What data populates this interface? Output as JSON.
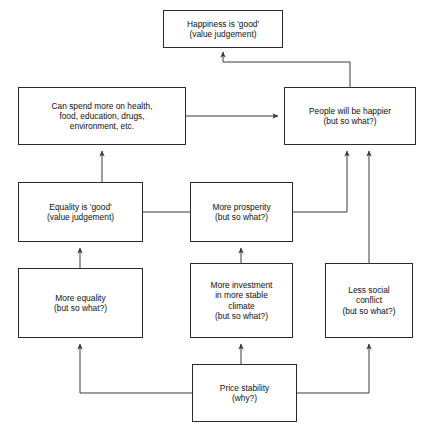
{
  "diagram": {
    "style": {
      "background": "#ffffff",
      "box_border": "#2b2b2b",
      "box_fill": "#ffffff",
      "connector": "#3a3a3a",
      "text": "#101010"
    },
    "nodes": [
      {
        "id": "happiness_good",
        "label": "Happiness is 'good'\n(value judgement)",
        "x": 163,
        "y": 10,
        "w": 120,
        "h": 38
      },
      {
        "id": "can_spend_more",
        "label": "Can spend more on health,\nfood, education, drugs,\nenvironment, etc.",
        "x": 18,
        "y": 87,
        "w": 168,
        "h": 58
      },
      {
        "id": "people_happier",
        "label": "People will be happier\n(but so what?)",
        "x": 284,
        "y": 87,
        "w": 132,
        "h": 58
      },
      {
        "id": "equality_good",
        "label": "Equality is 'good'\n(value judgement)",
        "x": 18,
        "y": 182,
        "w": 125,
        "h": 60
      },
      {
        "id": "more_prosperity",
        "label": "More prosperity\n(but so what?)",
        "x": 190,
        "y": 182,
        "w": 103,
        "h": 60
      },
      {
        "id": "more_equality",
        "label": "More equality\n(but so what?)",
        "x": 18,
        "y": 268,
        "w": 125,
        "h": 70
      },
      {
        "id": "more_investment",
        "label": "More investment\nin more stable\nclimate\n(but so what?)",
        "x": 190,
        "y": 263,
        "w": 103,
        "h": 75
      },
      {
        "id": "less_social_conflict",
        "label": "Less social\nconflict\n(but so what?)",
        "x": 325,
        "y": 263,
        "w": 88,
        "h": 75
      },
      {
        "id": "price_stability",
        "label": "Price stability\n(why?)",
        "x": 192,
        "y": 364,
        "w": 105,
        "h": 58
      }
    ],
    "connectors": [
      {
        "id": "people-happier-to-happiness-good",
        "from": "people_happier",
        "to": "happiness_good",
        "points": "350,87 350,62 223,62 223,52"
      },
      {
        "id": "can-spend-to-people-happier",
        "from": "can_spend_more",
        "to": "people_happier",
        "points": "186,116 278,116"
      },
      {
        "id": "more-prosperity-to-can-spend",
        "from": "more_prosperity",
        "to": "can_spend_more",
        "points": "190,212 102,212 102,151"
      },
      {
        "id": "more-prosperity-to-people-happier",
        "from": "more_prosperity",
        "to": "people_happier",
        "points": "293,212 347,212 347,151"
      },
      {
        "id": "more-equality-to-equality-good",
        "from": "more_equality",
        "to": "equality_good",
        "points": "80,268 80,248"
      },
      {
        "id": "more-investment-to-more-prosperity",
        "from": "more_investment",
        "to": "more_prosperity",
        "points": "241,263 241,248"
      },
      {
        "id": "less-social-conflict-to-people-happier",
        "from": "less_social_conflict",
        "to": "people_happier",
        "points": "369,263 369,151"
      },
      {
        "id": "price-stability-to-more-equality",
        "from": "price_stability",
        "to": "more_equality",
        "points": "192,393 80,393 80,344"
      },
      {
        "id": "price-stability-to-more-investment",
        "from": "price_stability",
        "to": "more_investment",
        "points": "241,364 241,344"
      },
      {
        "id": "price-stability-to-less-social-conflict",
        "from": "price_stability",
        "to": "less_social_conflict",
        "points": "297,393 369,393 369,344"
      }
    ]
  }
}
